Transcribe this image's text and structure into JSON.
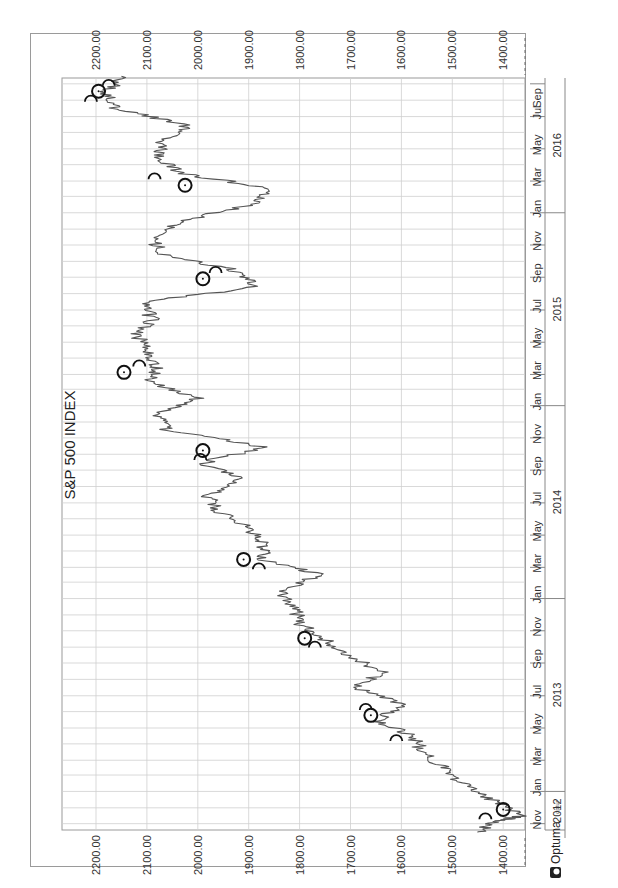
{
  "chart_data": {
    "type": "line",
    "orientation": "rotated-90-clockwise",
    "title": "S&P 500 INDEX",
    "xlabel": "",
    "ylabel": "",
    "ylim": [
      1340,
      2240
    ],
    "y_ticks": [
      "2200.00",
      "2100.00",
      "2000.00",
      "1900.00",
      "1800.00",
      "1700.00",
      "1600.00",
      "1500.00",
      "1400.00"
    ],
    "x_month_ticks": [
      "Nov",
      "Jan",
      "Mar",
      "May",
      "Jul",
      "Sep",
      "Nov",
      "Jan",
      "Mar",
      "May",
      "Jul",
      "Sep",
      "Nov",
      "Jan",
      "Mar",
      "May",
      "Jul",
      "Sep",
      "Nov",
      "Jan",
      "Mar",
      "May",
      "Jul",
      "Sep"
    ],
    "x_year_labels": [
      "2012",
      "2013",
      "2014",
      "2015",
      "2016"
    ],
    "grid": true,
    "legend": "none",
    "series": [
      {
        "name": "S&P 500",
        "x": [
          "2012-10",
          "2012-11-05",
          "2012-11-16",
          "2012-12",
          "2013-01",
          "2013-02",
          "2013-03",
          "2013-04",
          "2013-05",
          "2013-06",
          "2013-07",
          "2013-08",
          "2013-09",
          "2013-10",
          "2013-11",
          "2013-12",
          "2014-01",
          "2014-02",
          "2014-03",
          "2014-04",
          "2014-05",
          "2014-06",
          "2014-07",
          "2014-08",
          "2014-09",
          "2014-10",
          "2014-11",
          "2014-12",
          "2015-01",
          "2015-02",
          "2015-03",
          "2015-04",
          "2015-05",
          "2015-06",
          "2015-07",
          "2015-08",
          "2015-09",
          "2015-10",
          "2015-11",
          "2015-12",
          "2016-01",
          "2016-02",
          "2016-03",
          "2016-04",
          "2016-05",
          "2016-06",
          "2016-07",
          "2016-08",
          "2016-09"
        ],
        "values": [
          1450,
          1420,
          1360,
          1420,
          1480,
          1515,
          1560,
          1575,
          1650,
          1600,
          1690,
          1640,
          1700,
          1750,
          1800,
          1810,
          1840,
          1760,
          1870,
          1870,
          1900,
          1960,
          1980,
          1920,
          1990,
          1870,
          2060,
          2080,
          2000,
          2100,
          2080,
          2100,
          2120,
          2090,
          2110,
          1880,
          1930,
          2070,
          2090,
          2040,
          1900,
          1850,
          2030,
          2080,
          2070,
          2020,
          2160,
          2180,
          2150
        ]
      }
    ],
    "annotations": {
      "full_moon_markers": [
        {
          "date": "2012-11-28",
          "price": 1400
        },
        {
          "date": "2013-05-25",
          "price": 1660
        },
        {
          "date": "2013-10-18",
          "price": 1790
        },
        {
          "date": "2014-03-16",
          "price": 1910
        },
        {
          "date": "2014-10-08",
          "price": 1990
        },
        {
          "date": "2015-03-05",
          "price": 2145
        },
        {
          "date": "2015-08-29",
          "price": 1990
        },
        {
          "date": "2016-02-22",
          "price": 2025
        },
        {
          "date": "2016-08-18",
          "price": 2195
        }
      ],
      "new_moon_markers": [
        {
          "date": "2012-11-13",
          "price": 1435
        },
        {
          "date": "2013-04-10",
          "price": 1610
        },
        {
          "date": "2013-06-08",
          "price": 1670
        },
        {
          "date": "2013-10-04",
          "price": 1770
        },
        {
          "date": "2014-03-01",
          "price": 1880
        },
        {
          "date": "2014-09-24",
          "price": 1995
        },
        {
          "date": "2015-03-20",
          "price": 2115
        },
        {
          "date": "2015-09-13",
          "price": 1965
        },
        {
          "date": "2016-03-08",
          "price": 2085
        },
        {
          "date": "2016-08-02",
          "price": 2210
        },
        {
          "date": "2016-09-01",
          "price": 2175
        }
      ]
    }
  },
  "chart": {
    "title": "S&P 500 INDEX",
    "price_ticks": [
      "2200.00",
      "2100.00",
      "2000.00",
      "1900.00",
      "1800.00",
      "1700.00",
      "1600.00",
      "1500.00",
      "1400.00"
    ],
    "months": [
      "Nov",
      "Jan",
      "Mar",
      "May",
      "Jul",
      "Sep",
      "Nov",
      "Jan",
      "Mar",
      "May",
      "Jul",
      "Sep",
      "Nov",
      "Jan",
      "Mar",
      "May",
      "Jul",
      "Sep",
      "Nov",
      "Jan",
      "Mar",
      "May",
      "Jul",
      "Sep"
    ],
    "years": [
      "2012",
      "2013",
      "2014",
      "2015",
      "2016"
    ]
  },
  "footer": {
    "brand": "Optuma",
    "website": "optuma.com"
  }
}
